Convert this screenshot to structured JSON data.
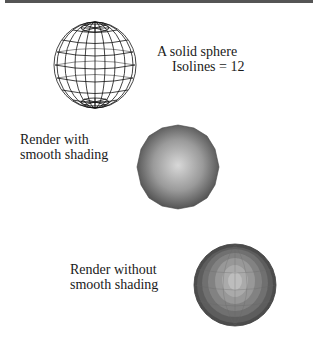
{
  "header": {
    "rule_color": "#555555"
  },
  "figures": [
    {
      "id": "wireframe-sphere",
      "caption_lines": [
        "A solid sphere",
        "Isolines = 12"
      ],
      "isolines": 12,
      "style": "wireframe",
      "stroke_color": "#111111"
    },
    {
      "id": "smooth-shaded-sphere",
      "caption_lines": [
        "Render with",
        "smooth shading"
      ],
      "style": "smooth",
      "highlight_color": "#d8d8d8",
      "shadow_color": "#4a4a4a"
    },
    {
      "id": "faceted-sphere",
      "caption_lines": [
        "Render without",
        "smooth shading"
      ],
      "style": "faceted",
      "highlight_color": "#bdbdbd",
      "shadow_color": "#4d4d4d"
    }
  ]
}
